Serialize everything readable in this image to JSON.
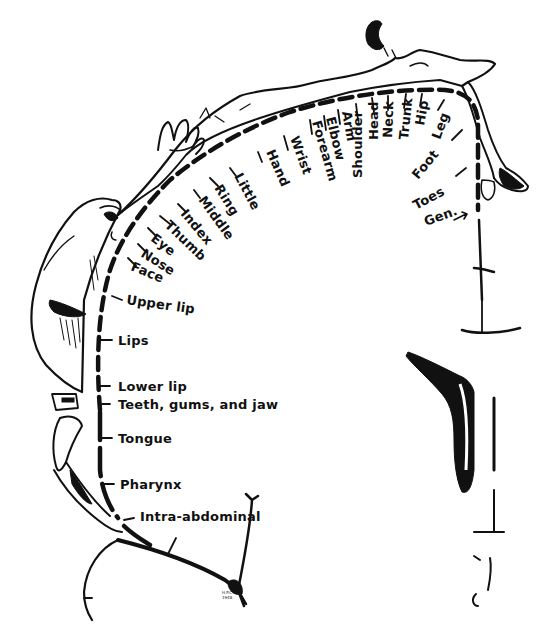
{
  "figure": {
    "style": "black ink line drawing on white",
    "colors": {
      "ink": "#111111",
      "background": "#ffffff"
    }
  },
  "labels": {
    "top_arc": [
      {
        "id": "little",
        "text": "Little"
      },
      {
        "id": "hand",
        "text": "Hand"
      },
      {
        "id": "wrist",
        "text": "Wrist"
      },
      {
        "id": "forearm",
        "text": "Forearm"
      },
      {
        "id": "elbow",
        "text": "Elbow"
      },
      {
        "id": "arm",
        "text": "Arm"
      },
      {
        "id": "shoulder",
        "text": "Shoulder"
      },
      {
        "id": "head",
        "text": "Head"
      },
      {
        "id": "neck",
        "text": "Neck"
      },
      {
        "id": "trunk",
        "text": "Trunk"
      },
      {
        "id": "hip",
        "text": "Hip"
      },
      {
        "id": "leg",
        "text": "Leg"
      },
      {
        "id": "foot",
        "text": "Foot"
      },
      {
        "id": "toes",
        "text": "Toes"
      },
      {
        "id": "gen",
        "text": "Gen."
      }
    ],
    "fingers": [
      {
        "id": "ring",
        "text": "Ring"
      },
      {
        "id": "middle",
        "text": "Middle"
      },
      {
        "id": "index",
        "text": "Index"
      },
      {
        "id": "thumb",
        "text": "Thumb"
      }
    ],
    "face": [
      {
        "id": "eye",
        "text": "Eye"
      },
      {
        "id": "nose",
        "text": "Nose"
      },
      {
        "id": "face",
        "text": "Face"
      },
      {
        "id": "upper_lip",
        "text": "Upper lip"
      },
      {
        "id": "lips",
        "text": "Lips"
      },
      {
        "id": "lower_lip",
        "text": "Lower lip"
      },
      {
        "id": "teeth",
        "text": "Teeth, gums, and jaw"
      },
      {
        "id": "tongue",
        "text": "Tongue"
      },
      {
        "id": "pharynx",
        "text": "Pharynx"
      },
      {
        "id": "intra",
        "text": "Intra-abdominal"
      }
    ]
  },
  "signature": {
    "line1": "H.P.C.",
    "line2": "1948"
  }
}
